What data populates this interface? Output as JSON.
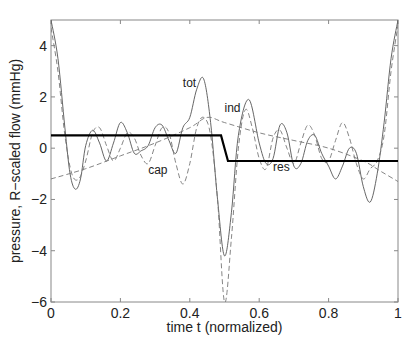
{
  "chart_data": {
    "type": "line",
    "title": "",
    "xlabel": "time t (normalized)",
    "ylabel": "pressure, R−scaled flow (mmHg)",
    "xlim": [
      0,
      1
    ],
    "ylim": [
      -6,
      5
    ],
    "xticks": [
      0,
      0.2,
      0.4,
      0.6,
      0.8,
      1
    ],
    "xtick_labels": [
      "0",
      "0.2",
      "0.4",
      "0.6",
      "0.8",
      "1"
    ],
    "yticks": [
      -6,
      -4,
      -2,
      0,
      2,
      4
    ],
    "ytick_labels": [
      "−6",
      "−4",
      "−2",
      "0",
      "2",
      "4"
    ],
    "grid": false,
    "legend": "none",
    "series": [
      {
        "name": "tot",
        "style": "solid-thin",
        "x": [
          0,
          0.02,
          0.04,
          0.055,
          0.07,
          0.085,
          0.1,
          0.12,
          0.14,
          0.16,
          0.18,
          0.2,
          0.22,
          0.24,
          0.26,
          0.28,
          0.3,
          0.32,
          0.34,
          0.36,
          0.38,
          0.4,
          0.42,
          0.44,
          0.46,
          0.48,
          0.5,
          0.52,
          0.54,
          0.57,
          0.6,
          0.62,
          0.64,
          0.66,
          0.68,
          0.7,
          0.72,
          0.74,
          0.76,
          0.78,
          0.8,
          0.82,
          0.84,
          0.86,
          0.88,
          0.9,
          0.92,
          0.94,
          0.96,
          0.98,
          1
        ],
        "y": [
          5.0,
          3.5,
          0.8,
          -1.0,
          -1.6,
          -1.2,
          0.1,
          0.7,
          0.2,
          -0.5,
          0.2,
          1.0,
          0.6,
          -0.2,
          -0.1,
          0.1,
          0.8,
          0.9,
          0.3,
          -0.2,
          0.8,
          1.2,
          2.3,
          2.7,
          1.0,
          -2.0,
          -4.2,
          -2.5,
          0.5,
          1.9,
          0.2,
          -0.6,
          -0.4,
          0.9,
          0.6,
          -0.7,
          -0.6,
          0.3,
          0.5,
          -0.2,
          -0.7,
          -1.2,
          -0.7,
          0.0,
          -0.2,
          -1.5,
          -2.1,
          -1.0,
          1.0,
          3.5,
          5.0
        ]
      },
      {
        "name": "cap",
        "style": "dashed",
        "x": [
          0,
          0.02,
          0.04,
          0.06,
          0.08,
          0.1,
          0.12,
          0.14,
          0.16,
          0.18,
          0.2,
          0.22,
          0.24,
          0.26,
          0.28,
          0.3,
          0.32,
          0.34,
          0.36,
          0.38,
          0.4,
          0.42,
          0.44,
          0.46,
          0.48,
          0.5,
          0.52,
          0.54,
          0.56,
          0.58,
          0.6,
          0.62,
          0.64,
          0.66,
          0.68,
          0.7,
          0.72,
          0.74,
          0.76,
          0.78,
          0.8,
          0.82,
          0.84,
          0.86,
          0.88,
          0.9,
          0.92,
          0.94,
          0.96,
          0.98,
          1
        ],
        "y": [
          4.7,
          3.0,
          0.5,
          -1.0,
          -1.2,
          -0.5,
          0.6,
          0.8,
          0.1,
          -0.5,
          0.0,
          0.6,
          0.4,
          -0.3,
          -0.6,
          0.1,
          0.8,
          0.6,
          -0.6,
          -1.4,
          -0.6,
          0.8,
          1.2,
          0.5,
          -2.0,
          -6.0,
          -3.5,
          0.0,
          1.5,
          0.8,
          -0.4,
          -0.8,
          0.4,
          0.7,
          0.0,
          -0.6,
          0.2,
          0.9,
          0.5,
          -0.4,
          -0.5,
          0.3,
          1.0,
          0.4,
          -0.6,
          -1.2,
          -0.8,
          -0.5,
          0.5,
          3.0,
          4.8
        ]
      },
      {
        "name": "ind",
        "style": "dashed",
        "x": [
          0,
          0.1,
          0.2,
          0.3,
          0.4,
          0.45,
          0.5,
          0.6,
          0.7,
          0.8,
          0.9,
          0.95,
          1
        ],
        "y": [
          -1.2,
          -0.8,
          -0.3,
          0.2,
          0.8,
          1.2,
          1.0,
          0.6,
          0.3,
          0.0,
          -0.5,
          -0.9,
          -1.3
        ]
      },
      {
        "name": "res",
        "style": "solid-thick",
        "x": [
          0,
          0.49,
          0.5,
          0.51,
          1
        ],
        "y": [
          0.5,
          0.5,
          0.0,
          -0.5,
          -0.5
        ]
      }
    ],
    "annotations": [
      {
        "text": "tot",
        "x": 0.38,
        "y": 2.4
      },
      {
        "text": "ind",
        "x": 0.5,
        "y": 1.4
      },
      {
        "text": "cap",
        "x": 0.28,
        "y": -1.0
      },
      {
        "text": "res",
        "x": 0.64,
        "y": -0.9
      }
    ]
  }
}
